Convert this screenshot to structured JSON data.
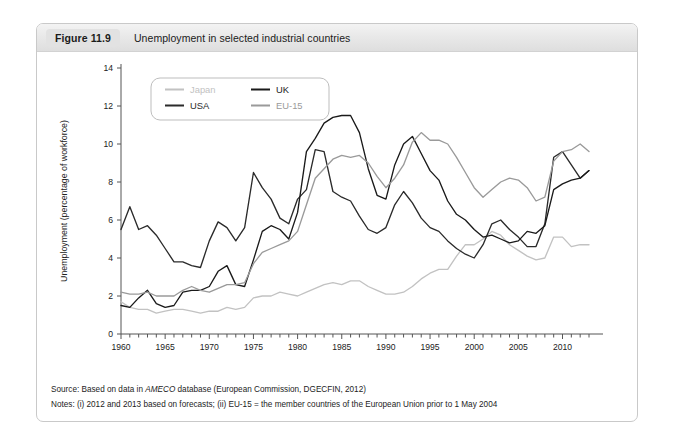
{
  "figure": {
    "badge": "Figure 11.9",
    "title": "Unemployment in selected industrial countries"
  },
  "notes": {
    "source_prefix": "Source: Based on data in ",
    "source_italic": "AMECO",
    "source_suffix": " database (European Commission, DGECFIN, 2012)",
    "notes_line": "Notes: (i) 2012 and 2013 based on forecasts; (ii) EU-15 = the member countries of the European Union prior to 1 May 2004"
  },
  "colors": {
    "japan": "#c2c2c2",
    "usa": "#2b2b2b",
    "uk": "#1a1a1a",
    "eu15": "#9a9a9a",
    "axis": "#555555",
    "text": "#222222"
  },
  "chart_data": {
    "type": "line",
    "title": "Unemployment in selected industrial countries",
    "xlabel": "",
    "ylabel": "Unemployment (percentage of workforce)",
    "xlim": [
      1960,
      2013
    ],
    "ylim": [
      0,
      14
    ],
    "ytick_step": 2,
    "yticks": [
      0,
      2,
      4,
      6,
      8,
      10,
      12,
      14
    ],
    "xticks": [
      1960,
      1965,
      1970,
      1975,
      1980,
      1985,
      1990,
      1995,
      2000,
      2005,
      2010
    ],
    "xtick_minor_step": 1,
    "grid": false,
    "legend_position": "top-left",
    "x": [
      1960,
      1961,
      1962,
      1963,
      1964,
      1965,
      1966,
      1967,
      1968,
      1969,
      1970,
      1971,
      1972,
      1973,
      1974,
      1975,
      1976,
      1977,
      1978,
      1979,
      1980,
      1981,
      1982,
      1983,
      1984,
      1985,
      1986,
      1987,
      1988,
      1989,
      1990,
      1991,
      1992,
      1993,
      1994,
      1995,
      1996,
      1997,
      1998,
      1999,
      2000,
      2001,
      2002,
      2003,
      2004,
      2005,
      2006,
      2007,
      2008,
      2009,
      2010,
      2011,
      2012,
      2013
    ],
    "series": [
      {
        "name": "Japan",
        "color": "#c2c2c2",
        "values": [
          1.7,
          1.4,
          1.3,
          1.3,
          1.1,
          1.2,
          1.3,
          1.3,
          1.2,
          1.1,
          1.2,
          1.2,
          1.4,
          1.3,
          1.4,
          1.9,
          2.0,
          2.0,
          2.2,
          2.1,
          2.0,
          2.2,
          2.4,
          2.6,
          2.7,
          2.6,
          2.8,
          2.8,
          2.5,
          2.3,
          2.1,
          2.1,
          2.2,
          2.5,
          2.9,
          3.2,
          3.4,
          3.4,
          4.1,
          4.7,
          4.7,
          5.0,
          5.4,
          5.2,
          4.7,
          4.4,
          4.1,
          3.9,
          4.0,
          5.1,
          5.1,
          4.6,
          4.7,
          4.7
        ]
      },
      {
        "name": "USA",
        "color": "#2b2b2b",
        "values": [
          5.5,
          6.7,
          5.5,
          5.7,
          5.2,
          4.5,
          3.8,
          3.8,
          3.6,
          3.5,
          4.9,
          5.9,
          5.6,
          4.9,
          5.6,
          8.5,
          7.7,
          7.1,
          6.1,
          5.8,
          7.1,
          7.6,
          9.7,
          9.6,
          7.5,
          7.2,
          7.0,
          6.2,
          5.5,
          5.3,
          5.6,
          6.8,
          7.5,
          6.9,
          6.1,
          5.6,
          5.4,
          4.9,
          4.5,
          4.2,
          4.0,
          4.7,
          5.8,
          6.0,
          5.5,
          5.1,
          4.6,
          4.6,
          5.8,
          9.3,
          9.6,
          8.9,
          8.2,
          8.6
        ]
      },
      {
        "name": "UK",
        "color": "#1a1a1a",
        "values": [
          1.5,
          1.4,
          1.9,
          2.3,
          1.6,
          1.4,
          1.5,
          2.2,
          2.3,
          2.3,
          2.5,
          3.3,
          3.6,
          2.6,
          2.5,
          3.9,
          5.4,
          5.7,
          5.5,
          5.0,
          6.4,
          9.6,
          10.3,
          11.1,
          11.4,
          11.5,
          11.5,
          10.6,
          8.7,
          7.3,
          7.1,
          8.9,
          10.0,
          10.4,
          9.5,
          8.6,
          8.1,
          7.0,
          6.3,
          6.0,
          5.5,
          5.1,
          5.2,
          5.0,
          4.8,
          4.9,
          5.4,
          5.3,
          5.7,
          7.6,
          7.9,
          8.1,
          8.2,
          8.6
        ]
      },
      {
        "name": "EU-15",
        "color": "#9a9a9a",
        "values": [
          2.2,
          2.1,
          2.1,
          2.2,
          2.0,
          2.0,
          2.0,
          2.3,
          2.5,
          2.3,
          2.2,
          2.4,
          2.6,
          2.6,
          2.7,
          3.7,
          4.3,
          4.5,
          4.7,
          4.9,
          5.4,
          6.8,
          8.2,
          8.7,
          9.2,
          9.4,
          9.3,
          9.4,
          9.0,
          8.3,
          7.7,
          8.2,
          8.9,
          10.1,
          10.6,
          10.2,
          10.2,
          10.0,
          9.3,
          8.5,
          7.7,
          7.2,
          7.6,
          8.0,
          8.2,
          8.1,
          7.7,
          7.0,
          7.2,
          9.1,
          9.6,
          9.7,
          10.0,
          9.6
        ]
      }
    ]
  },
  "legend": [
    {
      "label": "Japan",
      "color": "#c2c2c2"
    },
    {
      "label": "UK",
      "color": "#1a1a1a"
    },
    {
      "label": "USA",
      "color": "#2b2b2b"
    },
    {
      "label": "EU-15",
      "color": "#9a9a9a"
    }
  ]
}
